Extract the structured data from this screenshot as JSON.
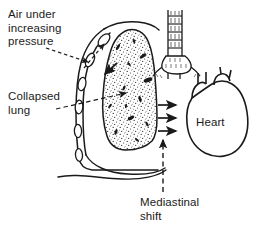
{
  "figure": {
    "background_color": "#ffffff",
    "ink_color": "#1a1a1a",
    "width": 257,
    "height": 234
  },
  "labels": {
    "air_pressure": "Air under\nincreasing\npressure",
    "collapsed_lung": "Collapsed\nlung",
    "heart": "Heart",
    "mediastinal_shift": "Mediastinal\nshift"
  },
  "annotations": {
    "air_pressure_leader": "dashed-arrow-to-pleural-space",
    "collapsed_lung_leader": "dashed-arrow-to-stippled-lung",
    "mediastinal_shift_leader": "dashed-arrow-up-to-mediastinum",
    "pressure_arrows": "three-solid-right-arrows",
    "pleural_arrow": "solid-arrow-into-chest-cavity"
  },
  "structures": {
    "chest_wall": "chest-wall-outline",
    "ribs_count": 6,
    "collapsed_lung": "stippled-lung-mass",
    "trachea": "trachea-with-cartilage-rings",
    "trachea_rings": 5,
    "bronchi": "bronchial-bifurcation",
    "heart": "heart-outline",
    "great_vessels": 2,
    "diaphragm": "diaphragm-curve"
  }
}
